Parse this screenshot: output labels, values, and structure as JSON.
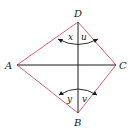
{
  "figure": {
    "vertices": {
      "A": {
        "label": "A",
        "x": 17,
        "y": 65
      },
      "B": {
        "label": "B",
        "x": 78,
        "y": 113
      },
      "C": {
        "label": "C",
        "x": 116,
        "y": 65
      },
      "D": {
        "label": "D",
        "x": 78,
        "y": 22
      }
    },
    "angles": {
      "x": "x",
      "u": "u",
      "y": "y",
      "v": "v"
    },
    "colors": {
      "edges": "#d9607a",
      "diagonals": "#1a1a1a"
    }
  }
}
